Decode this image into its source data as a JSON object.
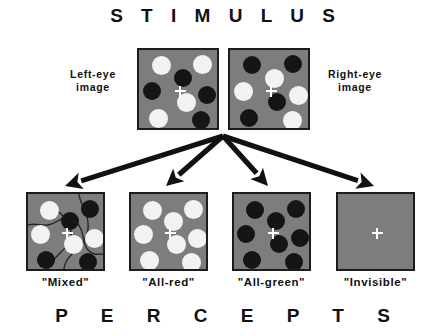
{
  "figure": {
    "top_title": "S T I M U L U S",
    "bottom_title": "P E R C E P T S",
    "background_color": "#ffffff",
    "panel_gray": "#7d7d7d",
    "panel_border_color": "#1c1c1c",
    "light_dot_color": "#f2f2f2",
    "dark_dot_color": "#151515",
    "arrow_color": "#111111",
    "fixation_color": "#ffffff"
  },
  "stimulus": {
    "left_eye": {
      "label": "Left-eye\nimage",
      "panel_name": "left-eye-stimulus-panel",
      "rect": {
        "x": 137,
        "y": 48,
        "w": 82,
        "h": 82
      },
      "fixation": {
        "x": 41,
        "y": 41
      },
      "dots": [
        {
          "cx": 22,
          "cy": 15,
          "r": 9.5,
          "tone": "light"
        },
        {
          "cx": 63,
          "cy": 14,
          "r": 9.5,
          "tone": "light"
        },
        {
          "cx": 44,
          "cy": 28,
          "r": 9,
          "tone": "dark"
        },
        {
          "cx": 13,
          "cy": 41,
          "r": 9,
          "tone": "dark"
        },
        {
          "cx": 68,
          "cy": 45,
          "r": 9,
          "tone": "dark"
        },
        {
          "cx": 47,
          "cy": 52,
          "r": 9.5,
          "tone": "light"
        },
        {
          "cx": 19,
          "cy": 68,
          "r": 9.5,
          "tone": "light"
        },
        {
          "cx": 62,
          "cy": 70,
          "r": 9,
          "tone": "dark"
        }
      ]
    },
    "right_eye": {
      "label": "Right-eye\nimage",
      "panel_name": "right-eye-stimulus-panel",
      "rect": {
        "x": 228,
        "y": 48,
        "w": 82,
        "h": 82
      },
      "fixation": {
        "x": 41,
        "y": 41
      },
      "dots": [
        {
          "cx": 22,
          "cy": 15,
          "r": 9,
          "tone": "dark"
        },
        {
          "cx": 63,
          "cy": 14,
          "r": 9,
          "tone": "dark"
        },
        {
          "cx": 44,
          "cy": 28,
          "r": 9.5,
          "tone": "light"
        },
        {
          "cx": 13,
          "cy": 41,
          "r": 9.5,
          "tone": "light"
        },
        {
          "cx": 68,
          "cy": 45,
          "r": 9.5,
          "tone": "light"
        },
        {
          "cx": 47,
          "cy": 52,
          "r": 9,
          "tone": "dark"
        },
        {
          "cx": 19,
          "cy": 68,
          "r": 9,
          "tone": "dark"
        },
        {
          "cx": 62,
          "cy": 70,
          "r": 9.5,
          "tone": "light"
        }
      ]
    }
  },
  "arrows": {
    "origin": {
      "x": 223,
      "y": 136
    },
    "targets": [
      {
        "name": "arrow-to-mixed",
        "x": 65,
        "y": 186
      },
      {
        "name": "arrow-to-all-red",
        "x": 166,
        "y": 186
      },
      {
        "name": "arrow-to-all-green",
        "x": 268,
        "y": 186
      },
      {
        "name": "arrow-to-invisible",
        "x": 374,
        "y": 186
      }
    ]
  },
  "percepts": [
    {
      "label": "\"Mixed\"",
      "panel_name": "percept-panel-mixed",
      "rect": {
        "x": 26,
        "y": 192,
        "w": 79,
        "h": 79
      },
      "fixation": {
        "x": 39,
        "y": 39
      },
      "has_contours": true,
      "dots": [
        {
          "cx": 21,
          "cy": 16,
          "r": 9.5,
          "tone": "light"
        },
        {
          "cx": 62,
          "cy": 15,
          "r": 9,
          "tone": "dark"
        },
        {
          "cx": 42,
          "cy": 27,
          "r": 9,
          "tone": "dark"
        },
        {
          "cx": 12,
          "cy": 40,
          "r": 9.5,
          "tone": "light"
        },
        {
          "cx": 66,
          "cy": 44,
          "r": 9.5,
          "tone": "light"
        },
        {
          "cx": 45,
          "cy": 50,
          "r": 9.5,
          "tone": "light"
        },
        {
          "cx": 18,
          "cy": 66,
          "r": 9,
          "tone": "dark"
        },
        {
          "cx": 60,
          "cy": 68,
          "r": 9,
          "tone": "dark"
        }
      ]
    },
    {
      "label": "\"All-red\"",
      "panel_name": "percept-panel-all-red",
      "rect": {
        "x": 129,
        "y": 192,
        "w": 79,
        "h": 79
      },
      "fixation": {
        "x": 39,
        "y": 39
      },
      "has_contours": false,
      "dots": [
        {
          "cx": 21,
          "cy": 16,
          "r": 9.5,
          "tone": "light"
        },
        {
          "cx": 62,
          "cy": 15,
          "r": 9.5,
          "tone": "light"
        },
        {
          "cx": 42,
          "cy": 27,
          "r": 9.5,
          "tone": "light"
        },
        {
          "cx": 12,
          "cy": 40,
          "r": 9.5,
          "tone": "light"
        },
        {
          "cx": 66,
          "cy": 44,
          "r": 9.5,
          "tone": "light"
        },
        {
          "cx": 45,
          "cy": 50,
          "r": 9.5,
          "tone": "light"
        },
        {
          "cx": 18,
          "cy": 66,
          "r": 9.5,
          "tone": "light"
        },
        {
          "cx": 60,
          "cy": 68,
          "r": 9.5,
          "tone": "light"
        }
      ]
    },
    {
      "label": "\"All-green\"",
      "panel_name": "percept-panel-all-green",
      "rect": {
        "x": 232,
        "y": 192,
        "w": 79,
        "h": 79
      },
      "fixation": {
        "x": 39,
        "y": 39
      },
      "has_contours": false,
      "dots": [
        {
          "cx": 21,
          "cy": 16,
          "r": 9,
          "tone": "dark"
        },
        {
          "cx": 62,
          "cy": 15,
          "r": 9,
          "tone": "dark"
        },
        {
          "cx": 42,
          "cy": 27,
          "r": 9,
          "tone": "dark"
        },
        {
          "cx": 12,
          "cy": 40,
          "r": 9,
          "tone": "dark"
        },
        {
          "cx": 66,
          "cy": 44,
          "r": 9,
          "tone": "dark"
        },
        {
          "cx": 45,
          "cy": 50,
          "r": 9,
          "tone": "dark"
        },
        {
          "cx": 18,
          "cy": 66,
          "r": 9,
          "tone": "dark"
        },
        {
          "cx": 60,
          "cy": 68,
          "r": 9,
          "tone": "dark"
        }
      ]
    },
    {
      "label": "\"Invisible\"",
      "panel_name": "percept-panel-invisible",
      "rect": {
        "x": 336,
        "y": 192,
        "w": 79,
        "h": 79
      },
      "fixation": {
        "x": 39,
        "y": 39
      },
      "has_contours": false,
      "dots": []
    }
  ]
}
